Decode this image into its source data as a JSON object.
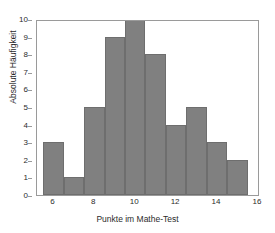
{
  "chart_data": {
    "type": "bar",
    "title": "",
    "subtitle": "",
    "xlabel": "Punkte im Mathe-Test",
    "ylabel": "Absolute Häufigkeit",
    "categories": [
      "6",
      "7",
      "8",
      "9",
      "10",
      "11",
      "12",
      "13",
      "14",
      "15"
    ],
    "values": [
      3,
      1,
      5,
      9,
      10,
      8,
      4,
      5,
      3,
      2
    ],
    "bin_edges": [
      5.5,
      6.5,
      7.5,
      8.5,
      9.5,
      10.5,
      11.5,
      12.5,
      13.5,
      14.5,
      15.5
    ],
    "bin_width": 1,
    "xlim": [
      5.2,
      16.1
    ],
    "ylim": [
      0,
      10
    ],
    "x_ticks": [
      6,
      8,
      10,
      12,
      14,
      16
    ],
    "x_tick_labels": [
      "6",
      "8",
      "10",
      "12",
      "14",
      "16"
    ],
    "y_ticks": [
      0,
      1,
      2,
      3,
      4,
      5,
      6,
      7,
      8,
      9,
      10
    ],
    "y_tick_labels": [
      "0",
      "1",
      "2",
      "3",
      "4",
      "5",
      "6",
      "7",
      "8",
      "9",
      "10"
    ],
    "grid": false,
    "legend": null,
    "legend_position": "none",
    "annotations": [],
    "bar_color": "#808080",
    "bar_edge_color": "#6e6e6e",
    "axis_color": "#9a9a9a",
    "text_color": "#2b2b2b",
    "background_color": "#ffffff",
    "total_count": 50
  }
}
